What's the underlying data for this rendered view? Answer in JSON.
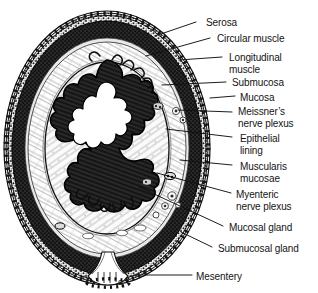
{
  "figure": {
    "type": "histological-diagram",
    "background_color": "#ffffff",
    "ink_color": "#141414",
    "center": {
      "x": 107,
      "y": 148
    },
    "outer_radius_x": 103,
    "outer_radius_y": 137
  },
  "labels": [
    {
      "id": "serosa",
      "text": "Serosa",
      "text_x": 206,
      "text_y": 17,
      "line_x1": 196,
      "line_y1": 22,
      "line_x2": 155,
      "line_y2": 36
    },
    {
      "id": "circular-muscle",
      "text": "Circular muscle",
      "text_x": 217,
      "text_y": 33,
      "line_x1": 210,
      "line_y1": 38,
      "line_x2": 146,
      "line_y2": 56
    },
    {
      "id": "longitudinal-1",
      "text": "Longitudinal",
      "text_x": 229,
      "text_y": 52,
      "line_x1": 222,
      "line_y1": 57,
      "line_x2": 179,
      "line_y2": 60
    },
    {
      "id": "longitudinal-2",
      "text": "muscle",
      "text_x": 229,
      "text_y": 64,
      "line_x1": null,
      "line_y1": null,
      "line_x2": null,
      "line_y2": null
    },
    {
      "id": "submucosa",
      "text": "Submucosa",
      "text_x": 232,
      "text_y": 77,
      "line_x1": 226,
      "line_y1": 82,
      "line_x2": 162,
      "line_y2": 85
    },
    {
      "id": "mucosa",
      "text": "Mucosa",
      "text_x": 240,
      "text_y": 92,
      "line_x1": 235,
      "line_y1": 96,
      "line_x2": 210,
      "line_y2": 98
    },
    {
      "id": "meissners-1",
      "text": "Meissner’s",
      "text_x": 238,
      "text_y": 106,
      "line_x1": 232,
      "line_y1": 112,
      "line_x2": 178,
      "line_y2": 110
    },
    {
      "id": "meissners-2",
      "text": "nerve plexus",
      "text_x": 238,
      "text_y": 118,
      "line_x1": null,
      "line_y1": null,
      "line_x2": null,
      "line_y2": null
    },
    {
      "id": "epithelial-1",
      "text": "Epithelial",
      "text_x": 240,
      "text_y": 133,
      "line_x1": 232,
      "line_y1": 137,
      "line_x2": 166,
      "line_y2": 129
    },
    {
      "id": "epithelial-2",
      "text": "lining",
      "text_x": 240,
      "text_y": 145,
      "line_x1": null,
      "line_y1": null,
      "line_x2": null,
      "line_y2": null
    },
    {
      "id": "muscularis-1",
      "text": "Muscularis",
      "text_x": 240,
      "text_y": 161,
      "line_x1": 232,
      "line_y1": 165,
      "line_x2": 180,
      "line_y2": 160
    },
    {
      "id": "muscularis-2",
      "text": "mucosae",
      "text_x": 240,
      "text_y": 173,
      "line_x1": null,
      "line_y1": null,
      "line_x2": null,
      "line_y2": null
    },
    {
      "id": "myenteric-1",
      "text": "Myenteric",
      "text_x": 236,
      "text_y": 189,
      "line_x1": 231,
      "line_y1": 193,
      "line_x2": 157,
      "line_y2": 173
    },
    {
      "id": "myenteric-2",
      "text": "nerve plexus",
      "text_x": 236,
      "text_y": 201,
      "line_x1": null,
      "line_y1": null,
      "line_x2": null,
      "line_y2": null
    },
    {
      "id": "mucosal-gland",
      "text": "Mucosal gland",
      "text_x": 229,
      "text_y": 222,
      "line_x1": 223,
      "line_y1": 226,
      "line_x2": 139,
      "line_y2": 187
    },
    {
      "id": "submucosal-gland",
      "text": "Submucosal gland",
      "text_x": 218,
      "text_y": 243,
      "line_x1": 212,
      "line_y1": 247,
      "line_x2": 181,
      "line_y2": 232
    },
    {
      "id": "mesentery",
      "text": "Mesentery",
      "text_x": 196,
      "text_y": 271,
      "line_x1": 192,
      "line_y1": 275,
      "line_x2": 134,
      "line_y2": 275
    }
  ],
  "layers": [
    {
      "id": "serosa",
      "name": "Serosa",
      "description": "outermost chain-like squamous epithelial border"
    },
    {
      "id": "longitudinal-muscle",
      "name": "Longitudinal muscle",
      "description": "outer dense stippled muscle band"
    },
    {
      "id": "circular-muscle",
      "name": "Circular muscle",
      "description": "thick dark inner muscle band"
    },
    {
      "id": "submucosa",
      "name": "Submucosa",
      "description": "pale fibrous connective layer with glands"
    },
    {
      "id": "mucosa",
      "name": "Mucosa",
      "description": "dark folded inner lining facing lumen"
    },
    {
      "id": "lumen",
      "name": "Lumen",
      "description": "central open white space"
    }
  ],
  "annotations": {
    "mesentery_marks": "q"
  }
}
